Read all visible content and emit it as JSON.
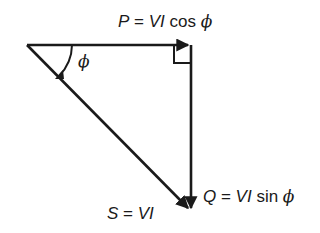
{
  "diagram": {
    "type": "power-triangle",
    "labels": {
      "real_power": {
        "lhs": "P",
        "eq": " = ",
        "rhs": "VI",
        "fn": " cos ",
        "var": "ϕ"
      },
      "reactive_power": {
        "lhs": "Q",
        "eq": " = ",
        "rhs": "VI",
        "fn": " sin ",
        "var": "ϕ"
      },
      "apparent_power": {
        "lhs": "S",
        "eq": " = ",
        "rhs": "VI"
      },
      "angle": "ϕ"
    },
    "colors": {
      "stroke": "#1a1a1a",
      "background": "#ffffff"
    }
  }
}
